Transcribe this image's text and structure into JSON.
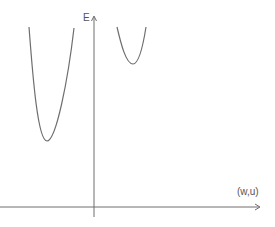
{
  "diagram": {
    "y_axis_label": "E",
    "x_axis_label": "(w,u)",
    "colors": {
      "stroke": "#6e6e6e",
      "text": "#555555",
      "background": "#ffffff"
    },
    "axes": {
      "x_axis": {
        "x1": 0,
        "x2": 260,
        "y": 207
      },
      "y_axis": {
        "x": 94,
        "y1": 16,
        "y2": 217
      }
    },
    "curves": [
      {
        "name": "left-well",
        "top_left": [
          29,
          27
        ],
        "minimum": [
          47,
          141
        ],
        "top_right": [
          74,
          28
        ]
      },
      {
        "name": "right-well",
        "top_left": [
          117,
          27
        ],
        "minimum": [
          133,
          64
        ],
        "top_right": [
          146,
          27
        ]
      }
    ]
  }
}
